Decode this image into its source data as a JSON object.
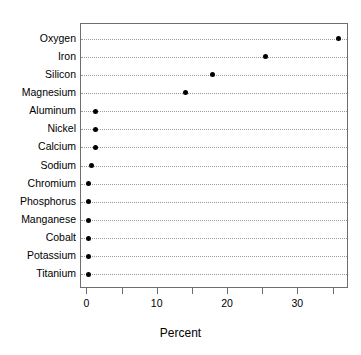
{
  "chart_data": {
    "type": "scatter",
    "subtype": "dot-plot",
    "title": "",
    "subtitle": "",
    "xlabel": "Percent",
    "ylabel": "",
    "orientation": "horizontal",
    "grid": true,
    "grid_style": "dotted-horizontal",
    "legend": false,
    "legend_position": "none",
    "xlim": [
      -0.9,
      37.2
    ],
    "xticks": [
      0,
      10,
      20,
      30
    ],
    "xtick_labels": [
      "0",
      "10",
      "20",
      "30"
    ],
    "xticks_minor": [
      5,
      15,
      25,
      35
    ],
    "categories": [
      "Oxygen",
      "Iron",
      "Silicon",
      "Magnesium",
      "Aluminum",
      "Nickel",
      "Calcium",
      "Sodium",
      "Chromium",
      "Phosphorus",
      "Manganese",
      "Cobalt",
      "Potassium",
      "Titanium"
    ],
    "values": [
      35.7,
      25.3,
      17.8,
      14.0,
      1.1,
      1.1,
      1.1,
      0.6,
      0.2,
      0.2,
      0.2,
      0.2,
      0.2,
      0.2
    ],
    "point_color": "#000000",
    "point_shape": "circle",
    "axis_color": "#6e6e6e",
    "grid_color": "#9a9a9a",
    "background": "#ffffff"
  }
}
